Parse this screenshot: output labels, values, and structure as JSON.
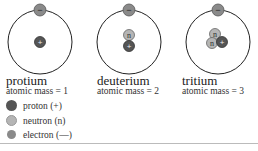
{
  "atoms": [
    {
      "name": "protium",
      "mass_label": "atomic mass = 1",
      "protons": 1,
      "neutrons": 0,
      "electrons": 1
    },
    {
      "name": "deuterium",
      "mass_label": "atomic mass = 2",
      "protons": 1,
      "neutrons": 1,
      "electrons": 1
    },
    {
      "name": "tritium",
      "mass_label": "atomic mass = 3",
      "protons": 1,
      "neutrons": 2,
      "electrons": 1
    }
  ],
  "symbols": {
    "proton": "+",
    "neutron": "n",
    "electron": "−"
  },
  "legend": [
    {
      "label": "proton (+)",
      "color": "#555555"
    },
    {
      "label": "neutron (n)",
      "color": "#b5b5b5"
    },
    {
      "label": "electron (—)",
      "color": "#8a8a8a"
    }
  ],
  "colors": {
    "proton": "#555555",
    "neutron": "#b5b5b5",
    "electron": "#8a8a8a",
    "orbit": "#222222"
  }
}
